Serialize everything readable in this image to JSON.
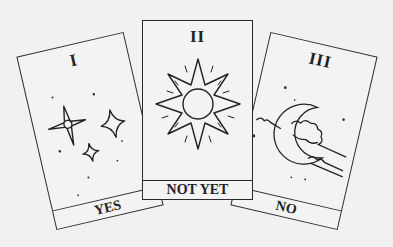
{
  "colors": {
    "background": "#f1f1f1",
    "card": "#f3f3f3",
    "ink": "#2a2a2a"
  },
  "cards": [
    {
      "numeral": "I",
      "label": "YES",
      "illustration": "three-sparkle-stars-icon"
    },
    {
      "numeral": "II",
      "label": "NOT YET",
      "illustration": "sun-icon"
    },
    {
      "numeral": "III",
      "label": "NO",
      "illustration": "crescent-moon-clouds-icon"
    }
  ]
}
